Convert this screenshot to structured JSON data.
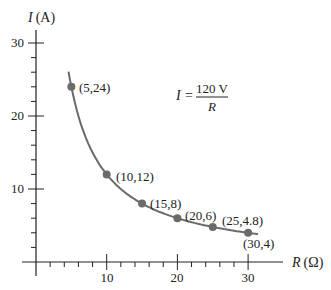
{
  "chart_data": {
    "type": "line",
    "title": "",
    "xlabel": "R (Ω)",
    "ylabel": "I (A)",
    "xlim": [
      0,
      32
    ],
    "ylim": [
      0,
      30
    ],
    "x_ticks": [
      10,
      20,
      30
    ],
    "y_ticks": [
      10,
      20,
      30
    ],
    "grid": false,
    "annotation": {
      "lhs": "I =",
      "numerator": "120 V",
      "denominator": "R"
    },
    "series": [
      {
        "name": "I = 120 V / R",
        "x": [
          5,
          10,
          15,
          20,
          25,
          30
        ],
        "values": [
          24,
          12,
          8,
          6,
          4.8,
          4
        ],
        "point_labels": [
          "(5,24)",
          "(10,12)",
          "(15,8)",
          "(20,6)",
          "(25,4.8)",
          "(30,4)"
        ]
      }
    ],
    "colors": {
      "curve": "#6b6b6b",
      "points": "#6b6b6b",
      "axis": "#222222"
    }
  },
  "axis": {
    "y_title_italic": "I",
    "y_title_unit": "(A)",
    "x_title_italic": "R",
    "x_title_unit": "(Ω)",
    "y_tick_labels": [
      "30",
      "20",
      "10"
    ],
    "x_tick_labels": [
      "10",
      "20",
      "30"
    ]
  },
  "labels": [
    "(5,24)",
    "(10,12)",
    "(15,8)",
    "(20,6)",
    "(25,4.8)",
    "(30,4)"
  ],
  "formula": {
    "lhs": "I",
    "eq": "=",
    "num": "120 V",
    "den": "R"
  }
}
